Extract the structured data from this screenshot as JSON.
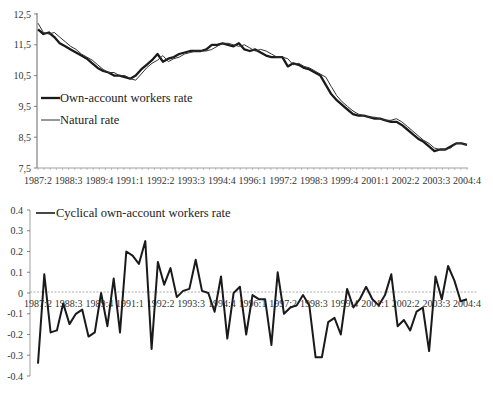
{
  "chart_data": [
    {
      "type": "line",
      "title": "",
      "xlabel": "",
      "ylabel": "",
      "ylim": [
        7.5,
        12.5
      ],
      "yticks": [
        "12,5",
        "11,5",
        "10,5",
        "9,5",
        "8,5",
        "7,5"
      ],
      "xtick_labels": [
        "1987:2",
        "1988:3",
        "1989:4",
        "1991:1",
        "1992:2",
        "1993:3",
        "1994:4",
        "1996:1",
        "1997:2",
        "1998:3",
        "1999:4",
        "2001:1",
        "2002:2",
        "2003:3",
        "2004:4"
      ],
      "legend": [
        "Own-account workers rate",
        "Natural rate"
      ],
      "legend_position": "inside-left",
      "grid": false,
      "series": [
        {
          "name": "Own-account workers rate",
          "values": [
            12.0,
            11.85,
            11.9,
            11.75,
            11.55,
            11.45,
            11.35,
            11.25,
            11.15,
            11.05,
            10.9,
            10.75,
            10.65,
            10.6,
            10.5,
            10.5,
            10.45,
            10.4,
            10.5,
            10.7,
            10.85,
            11.0,
            11.2,
            10.95,
            11.05,
            11.1,
            11.2,
            11.25,
            11.3,
            11.3,
            11.3,
            11.35,
            11.5,
            11.5,
            11.55,
            11.5,
            11.45,
            11.55,
            11.35,
            11.3,
            11.35,
            11.25,
            11.15,
            11.1,
            11.1,
            11.1,
            10.8,
            10.9,
            10.85,
            10.75,
            10.7,
            10.6,
            10.5,
            10.2,
            9.9,
            9.7,
            9.55,
            9.4,
            9.25,
            9.2,
            9.2,
            9.15,
            9.1,
            9.1,
            9.05,
            9.0,
            9.0,
            8.9,
            8.75,
            8.6,
            8.45,
            8.35,
            8.2,
            8.05,
            8.1,
            8.1,
            8.2,
            8.3,
            8.3,
            8.25
          ],
          "style": "thick"
        },
        {
          "name": "Natural rate",
          "values": [
            12.2,
            11.9,
            11.85,
            11.9,
            11.75,
            11.6,
            11.45,
            11.35,
            11.2,
            11.1,
            11.0,
            10.85,
            10.7,
            10.6,
            10.6,
            10.5,
            10.5,
            10.4,
            10.35,
            10.55,
            10.75,
            10.9,
            11.0,
            11.15,
            10.95,
            11.05,
            11.1,
            11.2,
            11.25,
            11.3,
            11.3,
            11.3,
            11.35,
            11.45,
            11.55,
            11.55,
            11.5,
            11.45,
            11.5,
            11.4,
            11.3,
            11.35,
            11.3,
            11.2,
            11.1,
            11.1,
            11.05,
            10.85,
            10.9,
            10.8,
            10.75,
            10.65,
            10.55,
            10.45,
            10.15,
            9.85,
            9.65,
            9.5,
            9.35,
            9.25,
            9.2,
            9.15,
            9.15,
            9.1,
            9.05,
            9.05,
            9.1,
            9.0,
            8.85,
            8.7,
            8.55,
            8.4,
            8.3,
            8.15,
            8.1,
            8.1,
            8.15,
            8.3,
            8.3,
            8.25
          ],
          "style": "thin"
        }
      ]
    },
    {
      "type": "line",
      "title": "",
      "xlabel": "",
      "ylabel": "",
      "ylim": [
        -0.4,
        0.4
      ],
      "yticks": [
        "0.4",
        "0.3",
        "0.2",
        "0.1",
        "0",
        "-0.1",
        "-0.2",
        "-0.3",
        "-0.4"
      ],
      "xtick_labels": [
        "1987:2",
        "1988:3",
        "1989:4",
        "1991:1",
        "1992:2",
        "1993:3",
        "1994:4",
        "1996:1",
        "1997:2",
        "1998:3",
        "1999:4",
        "2001:1",
        "2002:2",
        "2003:3",
        "2004:4"
      ],
      "legend": [
        "Cyclical own-account workers rate"
      ],
      "legend_position": "top-left",
      "grid": false,
      "series": [
        {
          "name": "Cyclical own-account workers rate",
          "values": [
            -0.34,
            0.09,
            -0.19,
            -0.18,
            -0.05,
            -0.15,
            -0.1,
            -0.08,
            -0.21,
            -0.19,
            0.0,
            -0.16,
            0.07,
            -0.19,
            0.2,
            0.18,
            0.14,
            0.25,
            -0.27,
            0.15,
            0.04,
            0.12,
            -0.02,
            0.01,
            0.02,
            0.16,
            0.01,
            0.0,
            -0.09,
            0.08,
            -0.22,
            0.0,
            0.03,
            -0.2,
            -0.01,
            -0.03,
            -0.03,
            -0.25,
            0.1,
            -0.1,
            -0.07,
            -0.06,
            -0.01,
            -0.06,
            -0.31,
            -0.31,
            -0.14,
            -0.12,
            -0.2,
            0.02,
            -0.07,
            -0.03,
            0.03,
            -0.03,
            -0.06,
            -0.01,
            0.09,
            -0.16,
            -0.13,
            -0.18,
            -0.09,
            -0.07,
            -0.28,
            0.08,
            -0.03,
            0.13,
            0.06,
            -0.04,
            -0.03
          ],
          "style": "thick"
        }
      ]
    }
  ]
}
